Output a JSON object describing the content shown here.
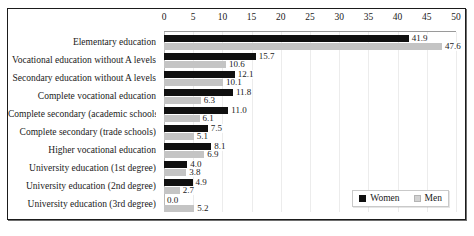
{
  "chart_data": {
    "type": "bar",
    "orientation": "horizontal",
    "title": "",
    "xlabel": "",
    "ylabel": "",
    "xlim": [
      0,
      50
    ],
    "xticks": [
      0,
      5,
      10,
      15,
      20,
      25,
      30,
      35,
      40,
      45,
      50
    ],
    "grid": true,
    "axis_position": "top",
    "legend_position": "bottom-right",
    "categories": [
      "Elementary education",
      "Vocational education without A levels",
      "Secondary education without A levels",
      "Complete vocational education",
      "Complete secondary (academic schools)",
      "Complete secondary (trade schools)",
      "Higher vocational education",
      "University education (1st degree)",
      "University education (2nd degree)",
      "University education (3rd degree)"
    ],
    "series": [
      {
        "name": "Women",
        "color": "#101010",
        "values": [
          41.9,
          15.7,
          12.1,
          11.8,
          11.0,
          7.5,
          8.1,
          4.0,
          4.9,
          0.0
        ],
        "labels": [
          "41.9",
          "15.7",
          "12.1",
          "11.8",
          "11.0",
          "7.5",
          "8.1",
          "4.0",
          "4.9",
          "0.0"
        ]
      },
      {
        "name": "Men",
        "color": "#c4c4c4",
        "values": [
          47.6,
          10.6,
          10.1,
          6.3,
          6.1,
          5.1,
          6.9,
          3.8,
          2.7,
          5.2
        ],
        "labels": [
          "47.6",
          "10.6",
          "10.1",
          "6.3",
          "6.1",
          "5.1",
          "6.9",
          "3.8",
          "2.7",
          "5.2"
        ]
      }
    ]
  }
}
